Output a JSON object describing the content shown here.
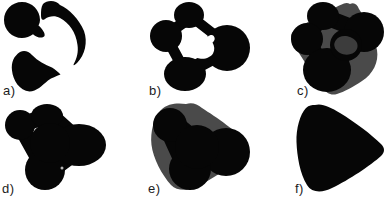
{
  "figure": {
    "panels": [
      {
        "label": "a)"
      },
      {
        "label": "b)"
      },
      {
        "label": "c)"
      },
      {
        "label": "d)"
      },
      {
        "label": "e)"
      },
      {
        "label": "f)"
      }
    ],
    "colors": {
      "ink": "#060606",
      "gray": "#4a4a4a",
      "patch": "#3c3c3c",
      "dot": "#b4b4b4",
      "white": "#ffffff"
    }
  }
}
